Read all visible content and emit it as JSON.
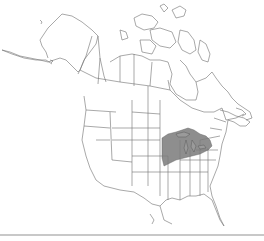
{
  "map": {
    "region": "North America",
    "title": "",
    "colors": {
      "background": "#ffffff",
      "outline": "#6e6e6e",
      "range_fill": "#7a7a7a",
      "bottom_rule": "#c8c8c8"
    },
    "range": {
      "label": "Distribution range",
      "description": "Upper Midwest / Great Lakes region"
    }
  }
}
